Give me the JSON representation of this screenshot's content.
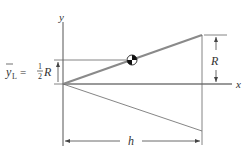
{
  "diagram": {
    "type": "cone-centroid-geometry",
    "axes": {
      "x_label": "x",
      "y_label": "y"
    },
    "labels": {
      "centroid_formula": {
        "lhs": "y",
        "subscript": "L",
        "equals": "=",
        "fraction_num": "1",
        "fraction_den": "2",
        "rhs": "R"
      },
      "radius_label": "R",
      "height_label": "h"
    },
    "colors": {
      "generator_line": "#8a8a8a",
      "axis": "#555555",
      "thin_line": "#666666",
      "text": "#333333"
    }
  }
}
